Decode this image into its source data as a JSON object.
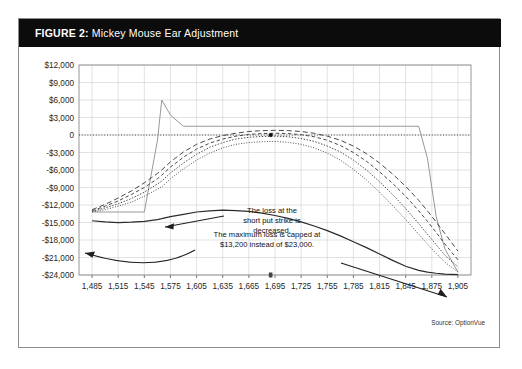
{
  "figure": {
    "number_label": "FIGURE 2:",
    "title": "Mickey Mouse Ear Adjustment",
    "source": "Source: OptionVue"
  },
  "annotations": [
    {
      "id": "short-put-strike-note",
      "lines": [
        "The loss at the",
        "short put strike is",
        "decreased."
      ],
      "text": "The loss at the short put strike is decreased."
    },
    {
      "id": "max-loss-note",
      "lines": [
        "The maximum loss is capped at",
        "$13,200 instead of $23,000."
      ],
      "text": "The maximum loss is capped at $13,200 instead of $23,000."
    }
  ],
  "chart_data": {
    "type": "line",
    "title": "Mickey Mouse Ear Adjustment",
    "xlabel": "",
    "ylabel": "",
    "xlim": [
      1470,
      1920
    ],
    "ylim": [
      -24000,
      12000
    ],
    "ytick_step": 3000,
    "xtick_step": 30,
    "grid": true,
    "legend": "none",
    "zero_reference_line": 0,
    "current_price_marker": 1690,
    "ytick_labels": [
      "$12,000",
      "$9,000",
      "$6,000",
      "$3,000",
      "0",
      "-$3,000",
      "-$6,000",
      "-$9,000",
      "-$12,000",
      "-$15,000",
      "-$18,000",
      "-$21,000",
      "-$24,000"
    ],
    "ytick_values": [
      12000,
      9000,
      6000,
      3000,
      0,
      -3000,
      -6000,
      -9000,
      -12000,
      -15000,
      -18000,
      -21000,
      -24000
    ],
    "xtick_labels": [
      "1,485",
      "1,515",
      "1,545",
      "1,575",
      "1,605",
      "1,635",
      "1,665",
      "1,695",
      "1,725",
      "1,755",
      "1,785",
      "1,815",
      "1,845",
      "1,875",
      "1,905"
    ],
    "xtick_values": [
      1485,
      1515,
      1545,
      1575,
      1605,
      1635,
      1665,
      1695,
      1725,
      1755,
      1785,
      1815,
      1845,
      1875,
      1905
    ],
    "x": [
      1485,
      1500,
      1515,
      1530,
      1545,
      1560,
      1565,
      1575,
      1590,
      1605,
      1620,
      1635,
      1650,
      1665,
      1680,
      1695,
      1710,
      1725,
      1740,
      1755,
      1770,
      1785,
      1800,
      1815,
      1830,
      1845,
      1860,
      1870,
      1880,
      1890,
      1905
    ],
    "series": [
      {
        "name": "At expiration (adjusted)",
        "style": "solid-light",
        "values": [
          -13200,
          -13200,
          -13200,
          -13200,
          -13200,
          -1000,
          6000,
          3400,
          1500,
          1500,
          1500,
          1500,
          1500,
          1500,
          1500,
          1500,
          1500,
          1500,
          1500,
          1500,
          1500,
          1500,
          1500,
          1500,
          1500,
          1500,
          1500,
          -4000,
          -14000,
          -19500,
          -23500
        ]
      },
      {
        "name": "T+ curve 1 (nearest)",
        "style": "dash-long",
        "values": [
          -12800,
          -11900,
          -10800,
          -9600,
          -8200,
          -6600,
          -6000,
          -4600,
          -2900,
          -1600,
          -700,
          -100,
          300,
          600,
          750,
          800,
          750,
          600,
          300,
          -200,
          -900,
          -1900,
          -3200,
          -4800,
          -6700,
          -8800,
          -11200,
          -13000,
          -14900,
          -16900,
          -19900
        ]
      },
      {
        "name": "T+ curve 2",
        "style": "dash-med",
        "values": [
          -13000,
          -12200,
          -11300,
          -10200,
          -9000,
          -7500,
          -6900,
          -5500,
          -3800,
          -2400,
          -1400,
          -700,
          -200,
          100,
          250,
          300,
          250,
          50,
          -300,
          -900,
          -1800,
          -3000,
          -4500,
          -6300,
          -8300,
          -10500,
          -13000,
          -14800,
          -16700,
          -18700,
          -21400
        ]
      },
      {
        "name": "T+ curve 3",
        "style": "dot-med",
        "values": [
          -13100,
          -12500,
          -11800,
          -10900,
          -9800,
          -8400,
          -7900,
          -6500,
          -4800,
          -3300,
          -2100,
          -1300,
          -700,
          -400,
          -250,
          -200,
          -300,
          -600,
          -1100,
          -1900,
          -2900,
          -4300,
          -6000,
          -8000,
          -10200,
          -12600,
          -15200,
          -17000,
          -18800,
          -20600,
          -22600
        ]
      },
      {
        "name": "T+ curve 4 (furthest)",
        "style": "dot-fine",
        "values": [
          -13200,
          -12800,
          -12200,
          -11500,
          -10500,
          -9300,
          -8900,
          -7500,
          -5800,
          -4300,
          -3100,
          -2200,
          -1600,
          -1300,
          -1150,
          -1100,
          -1250,
          -1600,
          -2200,
          -3100,
          -4300,
          -5900,
          -7700,
          -9800,
          -12100,
          -14500,
          -17000,
          -18700,
          -20300,
          -21800,
          -23500
        ]
      },
      {
        "name": "Unadjusted position",
        "style": "solid-dark",
        "values": [
          -14700,
          -14900,
          -15000,
          -14950,
          -14800,
          -14500,
          -14350,
          -14000,
          -13600,
          -13200,
          -13000,
          -12900,
          -12950,
          -13100,
          -13400,
          -13800,
          -14300,
          -14900,
          -15600,
          -16400,
          -17300,
          -18300,
          -19300,
          -20400,
          -21500,
          -22500,
          -23200,
          -23500,
          -23700,
          -23850,
          -23950
        ]
      }
    ]
  }
}
